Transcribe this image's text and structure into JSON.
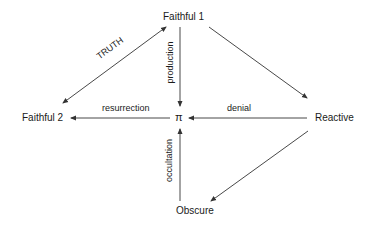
{
  "diagram": {
    "nodes": [
      {
        "id": "faithful1",
        "label": "Faithful 1"
      },
      {
        "id": "faithful2",
        "label": "Faithful 2"
      },
      {
        "id": "pi",
        "label": "π"
      },
      {
        "id": "reactive",
        "label": "Reactive"
      },
      {
        "id": "obscure",
        "label": "Obscure"
      }
    ],
    "edges": [
      {
        "id": "truth",
        "from": "faithful1",
        "to": "faithful2",
        "label": "TRUTH",
        "bidirectional": true
      },
      {
        "id": "production",
        "from": "faithful1",
        "to": "pi",
        "label": "production",
        "bidirectional": false
      },
      {
        "id": "faithful1-reactive",
        "from": "faithful1",
        "to": "reactive",
        "label": "",
        "bidirectional": false
      },
      {
        "id": "denial",
        "from": "reactive",
        "to": "pi",
        "label": "denial",
        "bidirectional": false
      },
      {
        "id": "resurrection",
        "from": "pi",
        "to": "faithful2",
        "label": "resurrection",
        "bidirectional": false
      },
      {
        "id": "occultation",
        "from": "obscure",
        "to": "pi",
        "label": "occultation",
        "bidirectional": false
      },
      {
        "id": "reactive-obscure",
        "from": "reactive",
        "to": "obscure",
        "label": "",
        "bidirectional": false
      }
    ],
    "colors": {
      "line": "#333333",
      "text": "#1a1a1a",
      "background": "#ffffff"
    }
  }
}
